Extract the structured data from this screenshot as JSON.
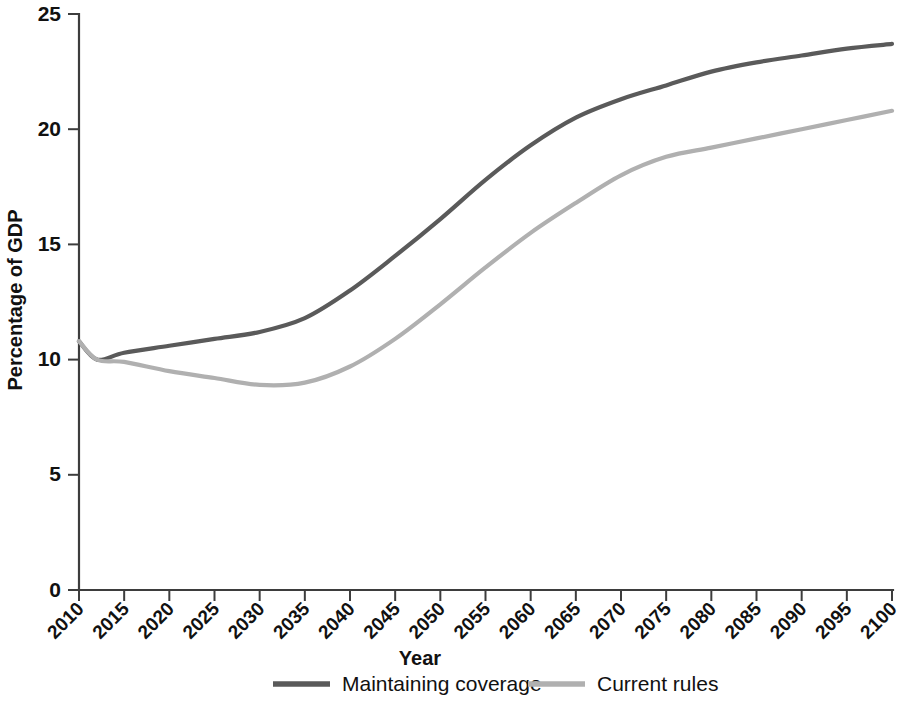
{
  "chart_data": {
    "type": "line",
    "title": "",
    "xlabel": "Year",
    "ylabel": "Percentage of GDP",
    "xlim": [
      2010,
      2100
    ],
    "ylim": [
      0,
      25
    ],
    "yticks": [
      0,
      5,
      10,
      15,
      20,
      25
    ],
    "ytick_labels": [
      "0",
      "5",
      "10",
      "15",
      "20",
      "25"
    ],
    "xticks": [
      2010,
      2015,
      2020,
      2025,
      2030,
      2035,
      2040,
      2045,
      2050,
      2055,
      2060,
      2065,
      2070,
      2075,
      2080,
      2085,
      2090,
      2095,
      2100
    ],
    "xtick_labels": [
      "2010",
      "2015",
      "2020",
      "2025",
      "2030",
      "2035",
      "2040",
      "2045",
      "2050",
      "2055",
      "2060",
      "2065",
      "2070",
      "2075",
      "2080",
      "2085",
      "2090",
      "2095",
      "2100"
    ],
    "grid": false,
    "legend_position": "bottom",
    "x": [
      2010,
      2012,
      2015,
      2020,
      2025,
      2030,
      2035,
      2040,
      2045,
      2050,
      2055,
      2060,
      2065,
      2070,
      2075,
      2080,
      2085,
      2090,
      2095,
      2100
    ],
    "series": [
      {
        "name": "Maintaining coverage",
        "color": "#5a5a5a",
        "values": [
          10.8,
          10.0,
          10.3,
          10.6,
          10.9,
          11.2,
          11.8,
          13.0,
          14.5,
          16.1,
          17.8,
          19.3,
          20.5,
          21.3,
          21.9,
          22.5,
          22.9,
          23.2,
          23.5,
          23.7
        ]
      },
      {
        "name": "Current rules",
        "color": "#b0b0b0",
        "values": [
          10.8,
          10.0,
          9.9,
          9.5,
          9.2,
          8.9,
          9.0,
          9.7,
          10.9,
          12.4,
          14.0,
          15.5,
          16.8,
          18.0,
          18.8,
          19.2,
          19.6,
          20.0,
          20.4,
          20.8
        ]
      }
    ],
    "legend": [
      {
        "label": "Maintaining coverage",
        "color": "#5a5a5a"
      },
      {
        "label": "Current rules",
        "color": "#b0b0b0"
      }
    ]
  },
  "axis": {
    "y_title": "Percentage of GDP",
    "x_title": "Year",
    "y_labels": [
      "25",
      "20",
      "15",
      "10",
      "5",
      "0"
    ],
    "x_labels": [
      "2010",
      "2015",
      "2020",
      "2025",
      "2030",
      "2035",
      "2040",
      "2045",
      "2050",
      "2055",
      "2060",
      "2065",
      "2070",
      "2075",
      "2080",
      "2085",
      "2090",
      "2095",
      "2100"
    ]
  },
  "legend": {
    "item_0_label": "Maintaining coverage",
    "item_1_label": "Current rules"
  },
  "colors": {
    "series_dark": "#5a5a5a",
    "series_light": "#b0b0b0",
    "axis": "#3d3d3d",
    "text": "#111111",
    "background": "#ffffff"
  }
}
